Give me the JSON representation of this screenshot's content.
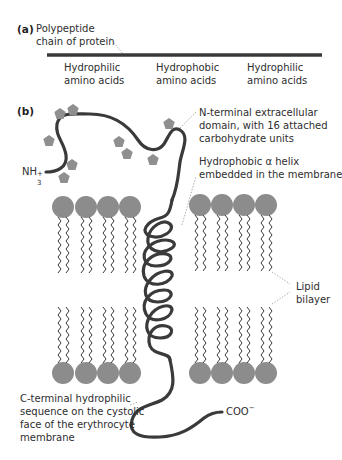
{
  "panel_a": {
    "label": "(a)",
    "chain_label_line1": "Polypeptide",
    "chain_label_line2": "chain of protein",
    "segments": [
      {
        "line1": "Hydrophilic",
        "line2": "amino acids"
      },
      {
        "line1": "Hydrophobic",
        "line2": "amino acids"
      },
      {
        "line1": "Hydrophilic",
        "line2": "amino acids"
      }
    ]
  },
  "panel_b": {
    "label": "(b)",
    "n_terminus": {
      "text": "NH",
      "sub": "3",
      "sup": "+"
    },
    "c_terminus": {
      "text": "COO",
      "sup": "−"
    },
    "annotations": {
      "n_terminal_domain": [
        "N-terminal extracellular",
        "domain, with 16 attached",
        "carbohydrate units"
      ],
      "alpha_helix": [
        "Hydrophobic α helix",
        "embedded in the membrane"
      ],
      "lipid_bilayer": [
        "Lipid",
        "bilayer"
      ],
      "c_terminal": [
        "C-terminal hydrophilic",
        "sequence on the cystolic",
        "face of the erythrocyte",
        "membrane"
      ]
    }
  },
  "colors": {
    "chain": "#3a3a3a",
    "lipid_head": "#8c8c8c",
    "carbohydrate": "#8f8f8f",
    "tail": "#3a3a3a",
    "leader": "#9a9a9a"
  }
}
